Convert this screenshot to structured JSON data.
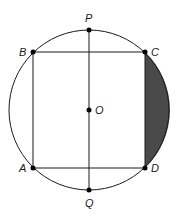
{
  "figure": {
    "type": "geometry",
    "circle": {
      "center_label": "O",
      "cx": 89,
      "cy": 110,
      "r": 80
    },
    "points": {
      "P": {
        "label": "P",
        "x": 89,
        "y": 30
      },
      "B": {
        "label": "B",
        "x": 33,
        "y": 52
      },
      "C": {
        "label": "C",
        "x": 145,
        "y": 52
      },
      "O": {
        "label": "O",
        "x": 89,
        "y": 110
      },
      "A": {
        "label": "A",
        "x": 33,
        "y": 168
      },
      "D": {
        "label": "D",
        "x": 145,
        "y": 168
      },
      "Q": {
        "label": "Q",
        "x": 89,
        "y": 190
      }
    },
    "shaded_region": {
      "bounded_by": [
        "segment CD",
        "arc CD"
      ],
      "color": "#4a4a4a"
    },
    "line_color": "#1a1a1a"
  }
}
